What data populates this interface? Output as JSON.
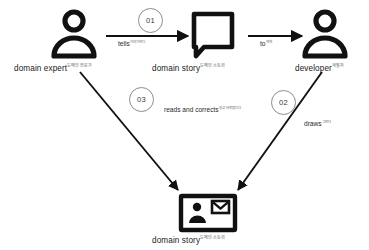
{
  "diagram": {
    "background_color": "#ffffff",
    "stroke_color": "#111111",
    "badge_stroke_color": "#8d8d8d",
    "nodes": [
      {
        "id": "domain-expert",
        "icon": "person-icon",
        "label": "domain expert",
        "label_sup": "도메인 전문가"
      },
      {
        "id": "domain-story-bubble",
        "icon": "speech-bubble-icon",
        "label": "domain story",
        "label_sup": "도메인 스토리"
      },
      {
        "id": "developer",
        "icon": "person-icon",
        "label": "developer",
        "label_sup": "개발자"
      },
      {
        "id": "domain-story-document",
        "icon": "id-card-icon",
        "label": "domain story",
        "label_sup": "도메인 스토리"
      }
    ],
    "edges": [
      {
        "id": "edge-01",
        "step": "01",
        "label": "tells",
        "label_sup": "이야기한다",
        "from": "domain-expert",
        "to": "domain-story-bubble"
      },
      {
        "id": "edge-to",
        "step": "",
        "label": "to",
        "label_sup": "에게",
        "from": "domain-story-bubble",
        "to": "developer"
      },
      {
        "id": "edge-02",
        "step": "02",
        "label": "draws",
        "label_sup": "그린다",
        "from": "developer",
        "to": "domain-story-document"
      },
      {
        "id": "edge-03",
        "step": "03",
        "label": "reads and corrects",
        "label_sup": "읽고 바로잡는다",
        "from": "domain-expert",
        "to": "domain-story-document"
      }
    ]
  }
}
